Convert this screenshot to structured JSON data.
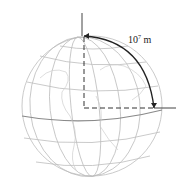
{
  "diagram": {
    "label_base": "10",
    "label_exponent": "7",
    "label_unit": "m",
    "colors": {
      "grid": "#bdbdbd",
      "coast": "#cfcfcf",
      "axis": "#444444",
      "arc": "#222222",
      "equator": "#8a8a8a"
    }
  }
}
